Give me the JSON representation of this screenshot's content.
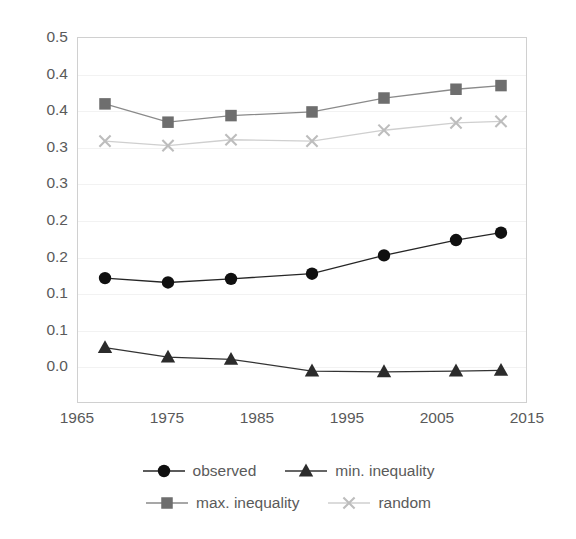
{
  "chart_data": {
    "type": "line",
    "title": "",
    "subtitle": "",
    "xlabel": "",
    "ylabel": "",
    "xlim": [
      1965,
      2015
    ],
    "ylim": [
      0.0,
      0.5
    ],
    "grid": true,
    "legend_position": "bottom",
    "x_ticks": [
      "1965",
      "1975",
      "1985",
      "1995",
      "2005",
      "2015"
    ],
    "x_tick_values": [
      1965,
      1975,
      1985,
      1995,
      2005,
      2015
    ],
    "y_ticks": [
      "0.5",
      "0.4",
      "0.4",
      "0.3",
      "0.3",
      "0.2",
      "0.2",
      "0.1",
      "0.1",
      "0.0"
    ],
    "y_tick_values": [
      0.5,
      0.45,
      0.4,
      0.35,
      0.3,
      0.25,
      0.2,
      0.15,
      0.1,
      0.05,
      0.0
    ],
    "x": [
      1968,
      1975,
      1982,
      1991,
      1999,
      2007,
      2012
    ],
    "series": [
      {
        "name": "observed",
        "marker": "circle",
        "color": "#101010",
        "line_color": "#262626",
        "values": [
          0.172,
          0.166,
          0.171,
          0.178,
          0.203,
          0.224,
          0.234
        ]
      },
      {
        "name": "min. inequality",
        "marker": "triangle",
        "color": "#2b2b2b",
        "line_color": "#333333",
        "values": [
          0.077,
          0.064,
          0.061,
          0.045,
          0.044,
          0.045,
          0.046
        ]
      },
      {
        "name": "max. inequality",
        "marker": "square",
        "color": "#6e6e6e",
        "line_color": "#8a8a8a",
        "values": [
          0.41,
          0.385,
          0.394,
          0.399,
          0.418,
          0.43,
          0.435
        ]
      },
      {
        "name": "random",
        "marker": "x",
        "color": "#bdbdbd",
        "line_color": "#cfcfcf",
        "values": [
          0.359,
          0.353,
          0.361,
          0.359,
          0.374,
          0.384,
          0.386
        ]
      }
    ]
  },
  "legend": {
    "items": [
      {
        "label": "observed"
      },
      {
        "label": "min. inequality"
      },
      {
        "label": "max. inequality"
      },
      {
        "label": "random"
      }
    ]
  },
  "colors": {
    "plot_border": "#d0d0d0",
    "gridline": "#f2f2f2",
    "tick_text": "#5a5a5a",
    "background": "#ffffff"
  }
}
